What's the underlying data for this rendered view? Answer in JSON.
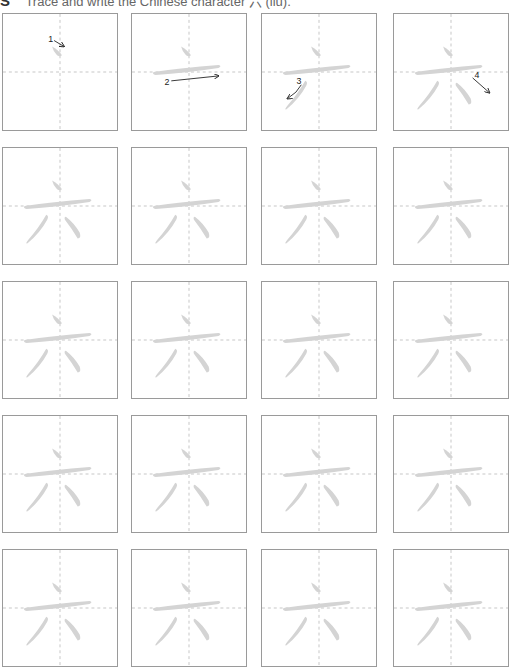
{
  "header": {
    "logo": "S",
    "instruction": "Trace and write the Chinese character 六 (liù)."
  },
  "character": {
    "glyph": "六",
    "pinyin": "liù",
    "stroke_count": 4
  },
  "colors": {
    "box_border": "#9a9a9a",
    "guide_line": "#b8b8b8",
    "trace_stroke": "#d4d4d4",
    "arrow": "#222222"
  },
  "grid": {
    "columns": [
      2,
      131,
      261,
      393
    ],
    "rows": [
      13,
      147,
      281,
      415,
      549
    ],
    "box_width": 116,
    "box_height": 118
  },
  "stroke_order_boxes": [
    {
      "step": 1,
      "label": "1",
      "strokes_shown": 1
    },
    {
      "step": 2,
      "label": "2",
      "strokes_shown": 2
    },
    {
      "step": 3,
      "label": "3",
      "strokes_shown": 3
    },
    {
      "step": 4,
      "label": "4",
      "strokes_shown": 4
    }
  ],
  "practice_boxes_count": 16
}
